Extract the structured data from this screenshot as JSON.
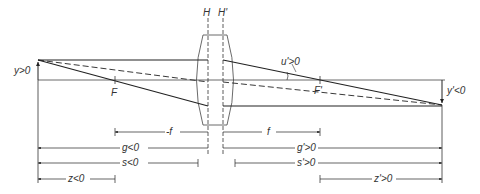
{
  "diagram": {
    "planes": {
      "H": "H",
      "H_prime": "H'"
    },
    "points": {
      "F": "F",
      "F_prime": "F'"
    },
    "object": {
      "label": "y>0"
    },
    "image": {
      "label": "y'<0"
    },
    "angle": {
      "label": "u'>0"
    },
    "dimensions": {
      "neg_f": "-f",
      "f": "f",
      "g": "g<0",
      "g_prime": "g'>0",
      "s": "s<0",
      "s_prime": "s'>0",
      "z": "z<0",
      "z_prime": "z'>0"
    },
    "colors": {
      "line": "#222222",
      "axis": "#444444"
    }
  }
}
